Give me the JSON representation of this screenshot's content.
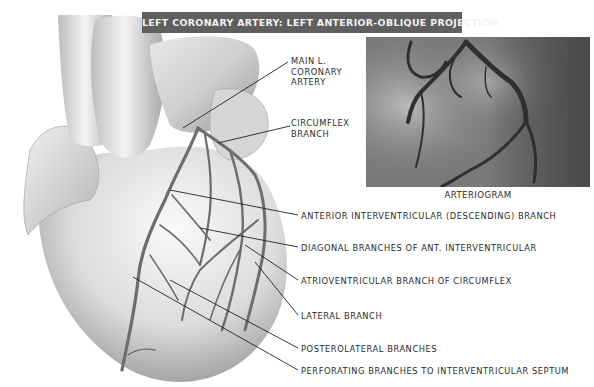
{
  "title": "LEFT CORONARY ARTERY: LEFT ANTERIOR-OBLIQUE PROJECTION",
  "inset": {
    "caption": "ARTERIOGRAM"
  },
  "labels": {
    "main_left_coronary": [
      "MAIN L.",
      "CORONARY",
      "ARTERY"
    ],
    "circumflex": [
      "CIRCUMFLEX",
      "BRANCH"
    ],
    "anterior_interventricular": "ANTERIOR INTERVENTRICULAR (DESCENDING) BRANCH",
    "diagonal": "DIAGONAL BRANCHES OF ANT. INTERVENTRICULAR",
    "atrioventricular": "ATRIOVENTRICULAR BRANCH OF CIRCUMFLEX",
    "lateral": "LATERAL BRANCH",
    "posterolateral": "POSTEROLATERAL BRANCHES",
    "perforating": "PERFORATING BRANCHES TO INTERVENTRICULAR SEPTUM"
  },
  "colors": {
    "banner_bg": "#5f5f5f",
    "banner_text": "#f2f2f2",
    "label_text": "#2a2a2a",
    "leader_line": "#222222"
  }
}
